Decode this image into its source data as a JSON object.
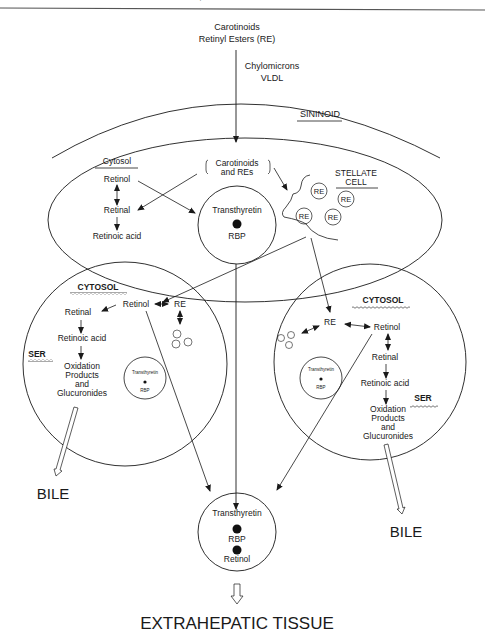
{
  "header": {
    "running_title": "Y, OVERVIEW AND METABOLIC FUNCTIONS"
  },
  "inputs": {
    "source_line1": "Carotinoids",
    "source_line2": "Retinyl Esters (RE)",
    "carrier_line1": "Chylomicrons",
    "carrier_line2": "VLDL"
  },
  "sininoid": {
    "label": "SININOID"
  },
  "top_cell": {
    "cytosol_label": "Cytosol",
    "retinol": "Retinol",
    "retinal": "Retinal",
    "retinoic_acid": "Retinoic acid",
    "carotinoids_line1": "Carotinoids",
    "carotinoids_line2": "and REs",
    "complex": {
      "protein": "Transthyretin",
      "binder": "RBP"
    }
  },
  "stellate_cell": {
    "label_line1": "STELLATE",
    "label_line2": "CELL",
    "droplets": [
      "RE",
      "RE",
      "RE",
      "RE"
    ]
  },
  "left_cell": {
    "cytosol_label": "CYTOSOL",
    "ser_label": "SER",
    "retinol": "Retinol",
    "re": "RE",
    "retinal": "Retinal",
    "retinoic_acid": "Retinoic acid",
    "products_line1": "Oxidation",
    "products_line2": "Products",
    "products_line3": "and",
    "products_line4": "Glucuronides",
    "droplets": [
      "RE",
      "RE",
      "RE"
    ],
    "complex": {
      "protein": "Transthyretin",
      "binder": "RBP"
    }
  },
  "right_cell": {
    "cytosol_label": "CYTOSOL",
    "ser_label": "SER",
    "retinol": "Retinol",
    "re": "RE",
    "retinal": "Retinal",
    "retinoic_acid": "Retinoic acid",
    "products_line1": "Oxidation",
    "products_line2": "Products",
    "products_line3": "and",
    "products_line4": "Glucuronides",
    "droplets": [
      "RE",
      "RE",
      "RE"
    ],
    "complex": {
      "protein": "Transthyretin",
      "binder": "RBP"
    }
  },
  "outputs": {
    "bile_left": "BILE",
    "bile_right": "BILE",
    "circulating_complex": {
      "protein": "Transthyretin",
      "binder": "RBP",
      "ligand": "Retinol"
    },
    "destination": "EXTRAHEPATIC TISSUE"
  }
}
